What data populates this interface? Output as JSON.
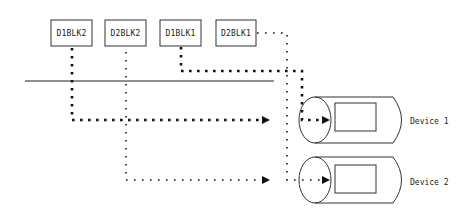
{
  "diagram": {
    "blocks": [
      {
        "label": "D1BLK2"
      },
      {
        "label": "D2BLK2"
      },
      {
        "label": "D1BLK1"
      },
      {
        "label": "D2BLK1"
      }
    ],
    "devices": [
      {
        "label": "Device 1"
      },
      {
        "label": "Device 2"
      }
    ],
    "colors": {
      "stroke": "#111111",
      "background": "#ffffff"
    }
  }
}
